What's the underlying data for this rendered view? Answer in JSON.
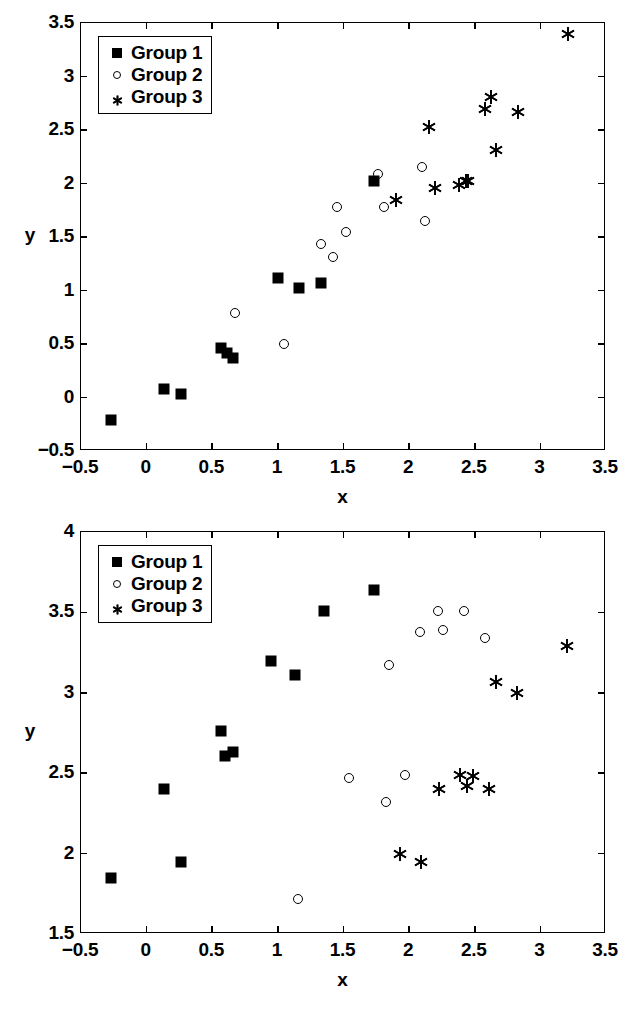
{
  "chart_data": [
    {
      "id": "top",
      "type": "scatter",
      "title": "",
      "xlabel": "x",
      "ylabel": "y",
      "xlim": [
        -0.5,
        3.5
      ],
      "ylim": [
        -0.5,
        3.5
      ],
      "xticks": [
        -0.5,
        0,
        0.5,
        1,
        1.5,
        2,
        2.5,
        3,
        3.5
      ],
      "xticklabels": [
        "-0.5",
        "0",
        "0.5",
        "1",
        "1.5",
        "2",
        "2.5",
        "3",
        "3.5"
      ],
      "yticks": [
        -0.5,
        0,
        0.5,
        1,
        1.5,
        2,
        2.5,
        3,
        3.5
      ],
      "yticklabels": [
        "-0.5",
        "0",
        "0.5",
        "1",
        "1.5",
        "2",
        "2.5",
        "3",
        "3.5"
      ],
      "grid": false,
      "legend_position": "upper left",
      "series": [
        {
          "name": "Group 1",
          "marker": "filled-square",
          "points": [
            [
              -0.27,
              -0.21
            ],
            [
              0.13,
              0.08
            ],
            [
              0.26,
              0.03
            ],
            [
              0.57,
              0.46
            ],
            [
              0.61,
              0.42
            ],
            [
              0.66,
              0.37
            ],
            [
              1.0,
              1.12
            ],
            [
              1.16,
              1.02
            ],
            [
              1.33,
              1.07
            ],
            [
              1.73,
              2.02
            ]
          ]
        },
        {
          "name": "Group 2",
          "marker": "open-circle",
          "points": [
            [
              0.67,
              0.79
            ],
            [
              1.05,
              0.5
            ],
            [
              1.33,
              1.43
            ],
            [
              1.42,
              1.31
            ],
            [
              1.45,
              1.78
            ],
            [
              1.52,
              1.55
            ],
            [
              1.76,
              2.09
            ],
            [
              1.81,
              1.78
            ],
            [
              2.1,
              2.15
            ],
            [
              2.12,
              1.65
            ]
          ]
        },
        {
          "name": "Group 3",
          "marker": "asterisk",
          "points": [
            [
              1.9,
              1.85
            ],
            [
              2.15,
              2.53
            ],
            [
              2.2,
              1.96
            ],
            [
              2.38,
              1.99
            ],
            [
              2.43,
              2.02
            ],
            [
              2.45,
              2.02
            ],
            [
              2.58,
              2.7
            ],
            [
              2.62,
              2.81
            ],
            [
              2.66,
              2.31
            ],
            [
              2.83,
              2.67
            ],
            [
              3.21,
              3.4
            ]
          ]
        }
      ]
    },
    {
      "id": "bottom",
      "type": "scatter",
      "title": "",
      "xlabel": "x",
      "ylabel": "y",
      "xlim": [
        -0.5,
        3.5
      ],
      "ylim": [
        1.5,
        4
      ],
      "xticks": [
        -0.5,
        0,
        0.5,
        1,
        1.5,
        2,
        2.5,
        3,
        3.5
      ],
      "xticklabels": [
        "-0.5",
        "0",
        "0.5",
        "1",
        "1.5",
        "2",
        "2.5",
        "3",
        "3.5"
      ],
      "yticks": [
        1.5,
        2,
        2.5,
        3,
        3.5,
        4
      ],
      "yticklabels": [
        "1.5",
        "2",
        "2.5",
        "3",
        "3.5",
        "4"
      ],
      "grid": false,
      "legend_position": "upper left",
      "series": [
        {
          "name": "Group 1",
          "marker": "filled-square",
          "points": [
            [
              -0.27,
              1.85
            ],
            [
              0.13,
              2.4
            ],
            [
              0.26,
              1.95
            ],
            [
              0.57,
              2.76
            ],
            [
              0.6,
              2.61
            ],
            [
              0.66,
              2.63
            ],
            [
              0.95,
              3.2
            ],
            [
              1.13,
              3.11
            ],
            [
              1.35,
              3.51
            ],
            [
              1.73,
              3.64
            ]
          ]
        },
        {
          "name": "Group 2",
          "marker": "open-circle",
          "points": [
            [
              1.15,
              1.72
            ],
            [
              1.54,
              2.47
            ],
            [
              1.82,
              2.32
            ],
            [
              1.85,
              3.17
            ],
            [
              1.97,
              2.49
            ],
            [
              2.08,
              3.38
            ],
            [
              2.22,
              3.51
            ],
            [
              2.26,
              3.39
            ],
            [
              2.42,
              3.51
            ],
            [
              2.58,
              3.34
            ]
          ]
        },
        {
          "name": "Group 3",
          "marker": "asterisk",
          "points": [
            [
              1.93,
              2.0
            ],
            [
              2.09,
              1.95
            ],
            [
              2.23,
              2.4
            ],
            [
              2.39,
              2.49
            ],
            [
              2.44,
              2.42
            ],
            [
              2.49,
              2.48
            ],
            [
              2.61,
              2.4
            ],
            [
              2.66,
              3.07
            ],
            [
              2.82,
              3.0
            ],
            [
              3.2,
              3.29
            ]
          ]
        }
      ]
    }
  ],
  "legend": {
    "entries": [
      {
        "label": "Group 1",
        "marker": "filled-square"
      },
      {
        "label": "Group 2",
        "marker": "open-circle"
      },
      {
        "label": "Group 3",
        "marker": "asterisk"
      }
    ]
  },
  "colors": {
    "ink": "#000000",
    "background": "#ffffff"
  }
}
